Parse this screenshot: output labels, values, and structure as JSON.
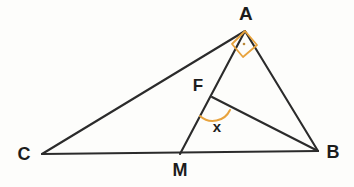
{
  "figure": {
    "kind": "plane-geometry-diagram",
    "background_color": "#fdfdfb",
    "stroke_color": "#2b2b2b",
    "mark_color": "#e8a33d",
    "width": 354,
    "height": 187
  },
  "points": {
    "A": {
      "label": "A",
      "x": 245,
      "y": 31,
      "label_x": 246,
      "label_y": 14
    },
    "B": {
      "label": "B",
      "x": 318,
      "y": 151,
      "label_x": 333,
      "label_y": 152
    },
    "C": {
      "label": "C",
      "x": 42,
      "y": 154,
      "label_x": 24,
      "label_y": 154
    },
    "M": {
      "label": "M",
      "x": 180,
      "y": 154,
      "label_x": 180,
      "label_y": 170
    },
    "F": {
      "label": "F",
      "x": 212,
      "y": 97,
      "label_x": 198,
      "label_y": 86
    }
  },
  "segments": [
    {
      "name": "CA",
      "from": "C",
      "to": "A"
    },
    {
      "name": "CB",
      "from": "C",
      "to": "B"
    },
    {
      "name": "AB",
      "from": "A",
      "to": "B"
    },
    {
      "name": "AM",
      "from": "A",
      "to": "M"
    },
    {
      "name": "FB",
      "from": "F",
      "to": "B"
    }
  ],
  "angle_marks": [
    {
      "name": "right-angle-at-A",
      "vertex": "A",
      "type": "right-angle-square",
      "label": "",
      "color": "#e8a33d",
      "square_points": "245,31 232,44 243,57 257,45",
      "dot": {
        "x": 244,
        "y": 44,
        "r": 1.3
      }
    },
    {
      "name": "angle-x-at-F",
      "vertex": "F",
      "type": "arc",
      "label": "x",
      "color": "#e8a33d",
      "label_x": 217,
      "label_y": 126,
      "arc_path": "M 200,116 A 19,19 0 0 0 230,110"
    }
  ],
  "labels": {
    "A": "A",
    "B": "B",
    "C": "C",
    "M": "M",
    "F": "F",
    "x": "x"
  }
}
